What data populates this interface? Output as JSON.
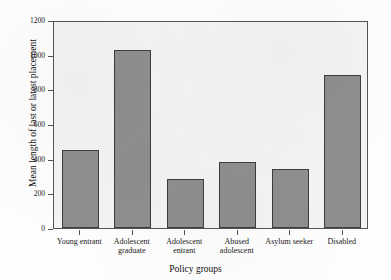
{
  "chart_data": {
    "type": "bar",
    "title": "",
    "xlabel": "Policy groups",
    "ylabel": "Mean length of last or latest placement",
    "categories": [
      "Young entrant",
      "Adolescent graduate",
      "Adolescent entrant",
      "Abused adolescent",
      "Asylum seeker",
      "Disabled"
    ],
    "category_lines": [
      [
        "Young entrant"
      ],
      [
        "Adolescent",
        "graduate"
      ],
      [
        "Adolescent",
        "entrant"
      ],
      [
        "Abused",
        "adolescent"
      ],
      [
        "Asylum seeker"
      ],
      [
        "Disabled"
      ]
    ],
    "values": [
      450,
      1025,
      280,
      380,
      340,
      880
    ],
    "ylim": [
      0,
      1200
    ],
    "yticks": [
      0,
      200,
      400,
      600,
      800,
      1000,
      1200
    ],
    "ytick_labels": [
      "0",
      "200",
      "400",
      "600",
      "800",
      "1000",
      "1200"
    ],
    "grid": false,
    "legend": false,
    "bar_fill_color": "#8e8e8e",
    "bar_edge_color": "#3d3d3d",
    "plot_background_color": "#f3f3f3",
    "axis_color": "#555555"
  }
}
